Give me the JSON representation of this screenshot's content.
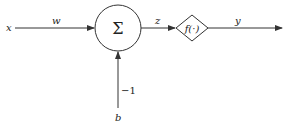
{
  "diagram": {
    "type": "neuron-model",
    "input_label": "x",
    "weight_label": "w",
    "summation_symbol": "Σ",
    "summation_output_label": "z",
    "activation_label": "f(·)",
    "output_label": "y",
    "bias_weight_label": "−1",
    "bias_label": "b",
    "colors": {
      "stroke": "#333333",
      "text": "#222222",
      "background": "#ffffff"
    }
  }
}
